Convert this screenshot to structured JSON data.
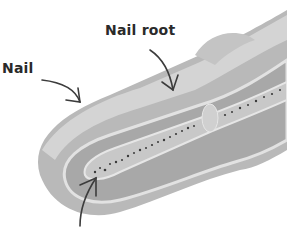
{
  "figure": {
    "labels": {
      "nail": "Nail",
      "nail_root": "Nail root"
    },
    "colors": {
      "background": "#ffffff",
      "skin_outer": "#b9b9b9",
      "skin_inner": "#a9a9a9",
      "nail": "#d2d2d2",
      "bone": "#c6c6c6",
      "marrow_dots": "#3a3a3a",
      "arrow": "#3c3c3c"
    },
    "arrows": [
      {
        "name": "nail-arrow",
        "from": [
          40,
          80
        ],
        "to": [
          80,
          100
        ]
      },
      {
        "name": "nail-root-arrow",
        "from": [
          150,
          50
        ],
        "to": [
          175,
          90
        ]
      },
      {
        "name": "bone-arrow",
        "from": [
          80,
          225
        ],
        "to": [
          95,
          180
        ]
      }
    ]
  }
}
